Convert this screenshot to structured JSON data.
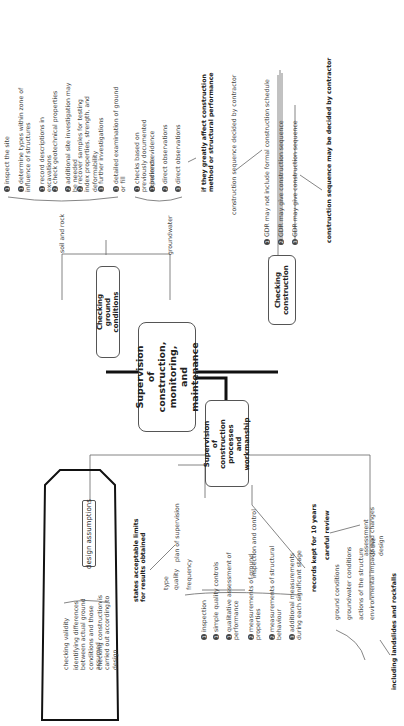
{
  "central": "Supervision of construction, monitoring, and maintenance",
  "branches": {
    "ground": {
      "title": "Checking ground conditions",
      "soil_label": "soil and rock",
      "groundwater_label": "groundwater",
      "soil_items": [
        {
          "n": "1",
          "text": "inspect the site"
        },
        {
          "n": "1",
          "text": "determine types within zone of influence of structures"
        },
        {
          "n": "1",
          "text": "record descriptions in excavations"
        },
        {
          "n": "2",
          "text": "check geotechnical properties"
        },
        {
          "n": "2",
          "text": "additional site investigation may be needed"
        },
        {
          "n": "2",
          "text": "recover samples for testing index properties, strength, and deformability"
        },
        {
          "n": "3",
          "text": "further investigations"
        },
        {
          "n": "3",
          "text": "detailed examination of ground or fill"
        }
      ],
      "groundwater_items": [
        {
          "n": "1",
          "text": "checks based on previously documented experience"
        },
        {
          "n": "1",
          "text": "indirect evidence"
        },
        {
          "n": "2",
          "text": "direct observations"
        },
        {
          "n": "3",
          "text": "direct observations"
        }
      ],
      "note": "if they greatly affect construction method or structural performance"
    },
    "construction": {
      "title": "Checking construction",
      "items": [
        {
          "n": "1",
          "text": "GDR may not include formal construction schedule"
        },
        {
          "n": "2",
          "text": "GDR may give construction sequence"
        },
        {
          "n": "3",
          "text": "GDR may give construction sequence"
        }
      ],
      "note_1": "construction sequence decided by contractor",
      "note_3": "construction sequence may be decided by contractor"
    },
    "workmanship": {
      "title": "Supervision of construction processes and workmanship",
      "design": {
        "title": "design assumptions",
        "items": [
          "checking validity",
          "identifying differences between actual ground conditions and those assumed",
          "checking construction is carried out according to design"
        ]
      },
      "plan": {
        "label": "plan of supervision",
        "note": "states acceptable limits for results obtained",
        "items": [
          "type",
          "quality",
          "frequency"
        ]
      },
      "inspection": {
        "label": "inspection and control",
        "items": [
          {
            "n": "1",
            "text": "inspection"
          },
          {
            "n": "1",
            "text": "simple quality controls"
          },
          {
            "n": "1",
            "text": "qualitative assessment of performance"
          },
          {
            "n": "2",
            "text": "measurements of ground properties"
          },
          {
            "n": "2",
            "text": "measurements of structural behaviour"
          },
          {
            "n": "3",
            "text": "additional measurements during each significant stage"
          }
        ],
        "note": "records kept for 10 years"
      },
      "assessment": {
        "label": "assessment of the design",
        "note": "careful review",
        "items": [
          "ground conditions",
          "groundwater conditions",
          "actions of the structure",
          "environmental impacts and changes"
        ],
        "sub_note": "including landslides and rockfalls"
      }
    }
  }
}
